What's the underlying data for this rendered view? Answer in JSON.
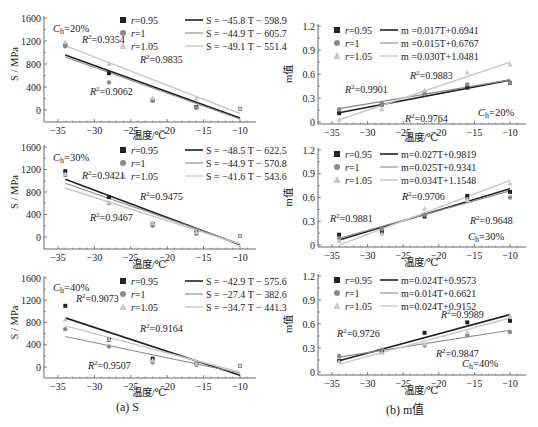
{
  "captions": {
    "left": "(a) S",
    "right": "(b) m值"
  },
  "legend_markers": [
    "r=0.95",
    "r=1",
    "r=1.05"
  ],
  "series_colors": {
    "r=0.95": "#222222",
    "r=1": "#8a8a8a",
    "r=1.05": "#c8c8c8"
  },
  "chart_data": [
    {
      "id": "S_20",
      "type": "scatter",
      "panel": "left-top",
      "title": "",
      "annotation": "Ch=20%",
      "xlabel": "温度/℃",
      "ylabel": "S / MPa",
      "xlim": [
        -37,
        -8
      ],
      "ylim": [
        -200,
        1600
      ],
      "xticks": [
        -35,
        -30,
        -25,
        -20,
        -15,
        -10
      ],
      "yticks": [
        0,
        400,
        800,
        1200,
        1600
      ],
      "x": [
        -34,
        -28,
        -22,
        -16,
        -10
      ],
      "series": [
        {
          "name": "r=0.95",
          "values": [
            1130,
            640,
            170,
            50,
            20
          ],
          "fit": "S = −45.8 T − 598.9",
          "slope": -45.8,
          "intercept": -598.9,
          "r2": "R²=0.9354"
        },
        {
          "name": "r=1",
          "values": [
            1110,
            480,
            160,
            40,
            20
          ],
          "fit": "S = −44.9 T − 605.7",
          "slope": -44.9,
          "intercept": -605.7,
          "r2": "R²=0.9062"
        },
        {
          "name": "r=1.05",
          "values": [
            1180,
            800,
            210,
            200,
            30
          ],
          "fit": "S = −49.1 T − 551.4",
          "slope": -49.1,
          "intercept": -551.4,
          "r2": "R²=0.9835"
        }
      ],
      "r2_labels": [
        {
          "text": "R²=0.9354",
          "x": 82,
          "y": 43
        },
        {
          "text": "R²=0.9835",
          "x": 140,
          "y": 63
        },
        {
          "text": "R²=0.9062",
          "x": 90,
          "y": 95
        }
      ]
    },
    {
      "id": "m_20",
      "type": "scatter",
      "panel": "right-top",
      "annotation": "Ch=20%",
      "xlabel": "温度/℃",
      "ylabel": "m值",
      "xlim": [
        -37,
        -8
      ],
      "ylim": [
        0,
        1.2
      ],
      "xticks": [
        -35,
        -30,
        -25,
        -20,
        -15,
        -10
      ],
      "yticks": [
        0,
        0.3,
        0.6,
        0.9,
        1.2
      ],
      "x": [
        -34,
        -28,
        -22,
        -16,
        -10
      ],
      "series": [
        {
          "name": "r=0.95",
          "values": [
            0.11,
            0.22,
            0.34,
            0.43,
            0.49
          ],
          "fit": "m =0.017T+0.6941",
          "slope": 0.017,
          "intercept": 0.6941,
          "r2": "R²=0.9901"
        },
        {
          "name": "r=1",
          "values": [
            0.16,
            0.22,
            0.35,
            0.47,
            0.49
          ],
          "fit": "m =0.015T+0.6767",
          "slope": 0.015,
          "intercept": 0.6767,
          "r2": "R²=0.9764"
        },
        {
          "name": "r=1.05",
          "values": [
            0.03,
            0.16,
            0.4,
            0.62,
            0.72
          ],
          "fit": "m =0.030T+1.0481",
          "slope": 0.03,
          "intercept": 1.0481,
          "r2": "R²=0.9883"
        }
      ],
      "r2_labels": [
        {
          "text": "R²=0.9901",
          "x": 345,
          "y": 93
        },
        {
          "text": "R²=0.9883",
          "x": 410,
          "y": 79
        },
        {
          "text": "R²=0.9764",
          "x": 405,
          "y": 122
        }
      ]
    },
    {
      "id": "S_30",
      "type": "scatter",
      "panel": "left-middle",
      "annotation": "Ch=30%",
      "xlabel": "温度/℃",
      "ylabel": "S / MPa",
      "xlim": [
        -37,
        -8
      ],
      "ylim": [
        -200,
        1600
      ],
      "xticks": [
        -35,
        -30,
        -25,
        -20,
        -15,
        -10
      ],
      "yticks": [
        0,
        400,
        800,
        1200,
        1600
      ],
      "x": [
        -34,
        -28,
        -22,
        -16,
        -10
      ],
      "series": [
        {
          "name": "r=0.95",
          "values": [
            1170,
            710,
            230,
            80,
            20
          ],
          "fit": "S = −48.5 T − 622.5",
          "slope": -48.5,
          "intercept": -622.5,
          "r2": "R²=0.9421"
        },
        {
          "name": "r=1",
          "values": [
            1100,
            600,
            200,
            60,
            20
          ],
          "fit": "S = −44.9 T − 570.8",
          "slope": -44.9,
          "intercept": -570.8,
          "r2": "R²=0.9467"
        },
        {
          "name": "r=1.05",
          "values": [
            1120,
            620,
            250,
            90,
            30
          ],
          "fit": "S = −41.6 T − 543.6",
          "slope": -41.6,
          "intercept": -543.6,
          "r2": "R²=0.9475"
        }
      ],
      "r2_labels": [
        {
          "text": "R²=0.9421",
          "x": 82,
          "y": 179
        },
        {
          "text": "R²=0.9475",
          "x": 140,
          "y": 200
        },
        {
          "text": "R²=0.9467",
          "x": 90,
          "y": 221
        }
      ]
    },
    {
      "id": "m_30",
      "type": "scatter",
      "panel": "right-middle",
      "annotation": "Ch=30%",
      "xlabel": "温度/℃",
      "ylabel": "m值",
      "xlim": [
        -37,
        -8
      ],
      "ylim": [
        0,
        1.2
      ],
      "xticks": [
        -35,
        -30,
        -25,
        -20,
        -15,
        -10
      ],
      "yticks": [
        0,
        0.3,
        0.6,
        0.9,
        1.2
      ],
      "x": [
        -34,
        -28,
        -22,
        -16,
        -10
      ],
      "series": [
        {
          "name": "r=0.95",
          "values": [
            0.13,
            0.17,
            0.36,
            0.62,
            0.67
          ],
          "fit": "m=0.027T+0.9819",
          "slope": 0.027,
          "intercept": 0.9819,
          "r2": "R²=0.9881"
        },
        {
          "name": "r=1",
          "values": [
            0.08,
            0.2,
            0.38,
            0.58,
            0.6
          ],
          "fit": "m=0.025T+0.9341",
          "slope": 0.025,
          "intercept": 0.9341,
          "r2": "R²=0.9706"
        },
        {
          "name": "r=1.05",
          "values": [
            0.05,
            0.14,
            0.46,
            0.57,
            0.78
          ],
          "fit": "m=0.034T+1.1548",
          "slope": 0.034,
          "intercept": 1.1548,
          "r2": "R²=0.9648"
        }
      ],
      "r2_labels": [
        {
          "text": "R²=0.9881",
          "x": 330,
          "y": 222
        },
        {
          "text": "R²=0.9706",
          "x": 402,
          "y": 200
        },
        {
          "text": "R²=0.9648",
          "x": 470,
          "y": 224
        }
      ]
    },
    {
      "id": "S_40",
      "type": "scatter",
      "panel": "left-bottom",
      "annotation": "Ch=40%",
      "xlabel": "温度/℃",
      "ylabel": "S / MPa",
      "xlim": [
        -37,
        -8
      ],
      "ylim": [
        -200,
        1600
      ],
      "xticks": [
        -35,
        -30,
        -25,
        -20,
        -15,
        -10
      ],
      "yticks": [
        0,
        400,
        800,
        1200,
        1600
      ],
      "x": [
        -34,
        -28,
        -22,
        -16,
        -10
      ],
      "series": [
        {
          "name": "r=0.95",
          "values": [
            1100,
            490,
            150,
            50,
            20
          ],
          "fit": "S = −42.9 T − 575.6",
          "slope": -42.9,
          "intercept": -575.6,
          "r2": "R²=0.9073"
        },
        {
          "name": "r=1",
          "values": [
            680,
            370,
            80,
            40,
            20
          ],
          "fit": "S = −27.4 T − 382.6",
          "slope": -27.4,
          "intercept": -382.6,
          "r2": "R²=0.9164"
        },
        {
          "name": "r=1.05",
          "values": [
            850,
            500,
            120,
            60,
            30
          ],
          "fit": "S = −34.7 T − 441.3",
          "slope": -34.7,
          "intercept": -441.3,
          "r2": "R²=0.9507"
        }
      ],
      "r2_labels": [
        {
          "text": "R²=0.9073",
          "x": 76,
          "y": 302
        },
        {
          "text": "R²=0.9164",
          "x": 140,
          "y": 332
        },
        {
          "text": "R²=0.9507",
          "x": 88,
          "y": 369
        }
      ]
    },
    {
      "id": "m_40",
      "type": "scatter",
      "panel": "right-bottom",
      "annotation": "Ch=40%",
      "xlabel": "温度/℃",
      "ylabel": "m值",
      "xlim": [
        -37,
        -8
      ],
      "ylim": [
        0,
        1.2
      ],
      "xticks": [
        -35,
        -30,
        -25,
        -20,
        -15,
        -10
      ],
      "yticks": [
        0,
        0.3,
        0.6,
        0.9,
        1.2
      ],
      "x": [
        -34,
        -28,
        -22,
        -16,
        -10
      ],
      "series": [
        {
          "name": "r=0.95",
          "values": [
            0.14,
            0.27,
            0.49,
            0.62,
            0.64
          ],
          "fit": "m=0.024T+0.9573",
          "slope": 0.024,
          "intercept": 0.9573,
          "r2": "R²=0.9726"
        },
        {
          "name": "r=1",
          "values": [
            0.2,
            0.28,
            0.33,
            0.46,
            0.5
          ],
          "fit": "m=0.014T+0.6621",
          "slope": 0.014,
          "intercept": 0.6621,
          "r2": "R²=0.9847"
        },
        {
          "name": "r=1.05",
          "values": [
            0.13,
            0.24,
            0.35,
            0.5,
            0.7
          ],
          "fit": "m=0.024T+0.9152",
          "slope": 0.024,
          "intercept": 0.9152,
          "r2": "R²=0.9989"
        }
      ],
      "r2_labels": [
        {
          "text": "R²=0.9726",
          "x": 337,
          "y": 337
        },
        {
          "text": "R²=0.9989",
          "x": 441,
          "y": 318
        },
        {
          "text": "R²=0.9847",
          "x": 436,
          "y": 357
        }
      ]
    }
  ],
  "panels_layout": [
    {
      "x0": 44,
      "yTop": 18,
      "yZero": 110,
      "bottom": 122,
      "xL": 58,
      "xR": 240,
      "right": 256,
      "legendX": 120,
      "legendY": 22,
      "fitX": 185,
      "annX": 53,
      "annY": 32,
      "xlabelY": 139
    },
    {
      "x0": 318,
      "yTop": 26,
      "yZero": 122,
      "bottom": 124,
      "xL": 332,
      "xR": 510,
      "right": 526,
      "legendX": 334,
      "legendY": 32,
      "fitX": 380,
      "annX": 478,
      "annY": 116,
      "xlabelY": 141
    },
    {
      "x0": 44,
      "yTop": 147,
      "yZero": 237,
      "bottom": 249,
      "xL": 58,
      "xR": 240,
      "right": 256,
      "legendX": 120,
      "legendY": 152,
      "fitX": 185,
      "annX": 53,
      "annY": 161,
      "xlabelY": 268
    },
    {
      "x0": 318,
      "yTop": 150,
      "yZero": 245,
      "bottom": 247,
      "xL": 332,
      "xR": 510,
      "right": 526,
      "legendX": 334,
      "legendY": 156,
      "fitX": 380,
      "annX": 468,
      "annY": 240,
      "xlabelY": 266
    },
    {
      "x0": 44,
      "yTop": 278,
      "yZero": 367,
      "bottom": 378,
      "xL": 58,
      "xR": 240,
      "right": 256,
      "legendX": 120,
      "legendY": 283,
      "fitX": 185,
      "annX": 53,
      "annY": 291,
      "xlabelY": 396
    },
    {
      "x0": 318,
      "yTop": 276,
      "yZero": 372,
      "bottom": 375,
      "xL": 332,
      "xR": 510,
      "right": 526,
      "legendX": 334,
      "legendY": 282,
      "fitX": 380,
      "annX": 462,
      "annY": 367,
      "xlabelY": 394
    }
  ]
}
